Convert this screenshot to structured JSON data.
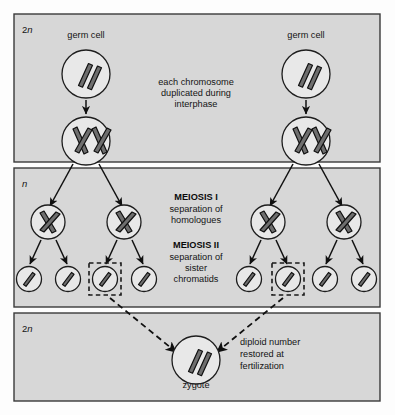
{
  "figure": {
    "colors": {
      "panel_fill": "#d7d7d7",
      "panel_stroke": "#3a3a3a",
      "cell_fill": "#e8e8e8",
      "cell_stroke": "#1d1d1d",
      "chromosome_fill": "#6e6e6e",
      "arrow": "#101010",
      "page_background": "#fdfdfd"
    }
  },
  "panels": [
    {
      "id": "top",
      "ploidy_label": "2n",
      "ploidy_prefix": "2",
      "ploidy_italic": "n"
    },
    {
      "id": "middle",
      "ploidy_label": "n",
      "ploidy_prefix": "",
      "ploidy_italic": "n"
    },
    {
      "id": "bottom",
      "ploidy_label": "2n",
      "ploidy_prefix": "2",
      "ploidy_italic": "n"
    }
  ],
  "cell_labels": {
    "germ_cell_left": "germ cell",
    "germ_cell_right": "germ cell",
    "zygote": "zygote"
  },
  "annotations": {
    "interphase": {
      "lines": [
        "each chromosome",
        "duplicated during",
        "interphase"
      ],
      "align": "center"
    },
    "meiosis_one": {
      "heading": "MEIOSIS I",
      "lines": [
        "separation of",
        "homologues"
      ],
      "align": "center"
    },
    "meiosis_two": {
      "heading": "MEIOSIS II",
      "lines": [
        "separation of",
        "sister",
        "chromatids"
      ],
      "align": "center"
    },
    "fertilization": {
      "lines": [
        "diploid number",
        "restored at",
        "fertilization"
      ],
      "align": "left"
    }
  },
  "stages": {
    "germ_cells": {
      "description": "diploid germ cell with two unduplicated rod chromosomes",
      "chromosome_shape": "rod",
      "chromosome_count": 2,
      "count": 2
    },
    "duplicated_cells": {
      "description": "germ cell after interphase with two duplicated X-shaped chromosomes",
      "chromosome_shape": "x-shaped",
      "chromosome_count": 2,
      "count": 2
    },
    "meiosis_i_products": {
      "description": "four cells each with one duplicated X-shaped chromosome",
      "chromosome_shape": "x-shaped",
      "chromosome_count": 1,
      "count": 4
    },
    "gametes": {
      "description": "eight haploid gametes each with a single chromatid",
      "chromosome_shape": "rod",
      "chromosome_count": 1,
      "count": 8,
      "highlighted_indices": [
        2,
        5
      ]
    },
    "zygote": {
      "description": "diploid zygote with two rod chromosomes",
      "chromosome_shape": "rod",
      "chromosome_count": 2,
      "count": 1
    }
  }
}
